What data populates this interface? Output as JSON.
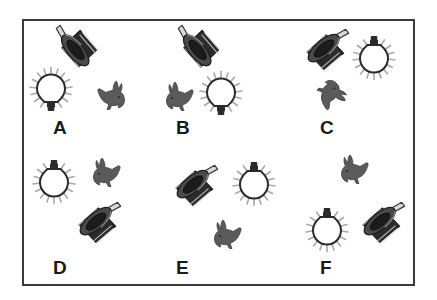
{
  "figure": {
    "border_color": "#3a3a3a",
    "background_color": "#ffffff"
  },
  "colors": {
    "hat_body": "#2b2b2b",
    "hat_highlight": "#e8e8e8",
    "hat_brim": "#4a4a4a",
    "wand": "#d9d9d9",
    "rabbit": "#5a5a5a",
    "bulb_glass": "#ffffff",
    "bulb_outline": "#2b2b2b",
    "bulb_rays": "#a9a9a9",
    "label_text": "#1b1b1b"
  },
  "icons": {
    "hat": "top-hat-with-wand-icon",
    "bulb": "light-bulb-icon",
    "rabbit": "rabbit-icon"
  },
  "panels": [
    {
      "id": "A",
      "label": "A",
      "objects": [
        {
          "type": "hat",
          "name": "top-hat-with-wand-icon",
          "left": 48,
          "top": 23,
          "rotate": 28
        },
        {
          "type": "bulb",
          "name": "light-bulb-icon",
          "left": 29,
          "top": 66,
          "rotate": 0
        },
        {
          "type": "rabbit",
          "name": "rabbit-icon",
          "left": 96,
          "top": 79,
          "rotate": 0,
          "flip": true
        }
      ]
    },
    {
      "id": "B",
      "label": "B",
      "objects": [
        {
          "type": "hat",
          "name": "top-hat-with-wand-icon",
          "left": 170,
          "top": 23,
          "rotate": 28
        },
        {
          "type": "rabbit",
          "name": "rabbit-icon",
          "left": 165,
          "top": 80,
          "rotate": 0,
          "flip": false
        },
        {
          "type": "bulb",
          "name": "light-bulb-icon",
          "left": 199,
          "top": 70,
          "rotate": 0
        }
      ]
    },
    {
      "id": "C",
      "label": "C",
      "objects": [
        {
          "type": "hat",
          "name": "top-hat-with-wand-icon",
          "left": 296,
          "top": 24,
          "rotate": 118
        },
        {
          "type": "bulb",
          "name": "light-bulb-icon",
          "left": 352,
          "top": 31,
          "rotate": 180
        },
        {
          "type": "rabbit",
          "name": "rabbit-icon",
          "left": 316,
          "top": 80,
          "rotate": 128,
          "flip": false
        }
      ]
    },
    {
      "id": "D",
      "label": "D",
      "objects": [
        {
          "type": "bulb",
          "name": "light-bulb-icon",
          "left": 32,
          "top": 155,
          "rotate": 180
        },
        {
          "type": "rabbit",
          "name": "rabbit-icon",
          "left": 92,
          "top": 156,
          "rotate": 0,
          "flip": false
        },
        {
          "type": "hat",
          "name": "top-hat-with-wand-icon",
          "left": 68,
          "top": 197,
          "rotate": 118
        }
      ]
    },
    {
      "id": "E",
      "label": "E",
      "objects": [
        {
          "type": "hat",
          "name": "top-hat-with-wand-icon",
          "left": 165,
          "top": 160,
          "rotate": 118
        },
        {
          "type": "bulb",
          "name": "light-bulb-icon",
          "left": 232,
          "top": 157,
          "rotate": 180
        },
        {
          "type": "rabbit",
          "name": "rabbit-icon",
          "left": 213,
          "top": 218,
          "rotate": 0,
          "flip": false
        }
      ]
    },
    {
      "id": "F",
      "label": "F",
      "objects": [
        {
          "type": "rabbit",
          "name": "rabbit-icon",
          "left": 340,
          "top": 153,
          "rotate": 0,
          "flip": false
        },
        {
          "type": "bulb",
          "name": "light-bulb-icon",
          "left": 305,
          "top": 203,
          "rotate": 180
        },
        {
          "type": "hat",
          "name": "top-hat-with-wand-icon",
          "left": 352,
          "top": 197,
          "rotate": 118
        }
      ]
    }
  ],
  "labels": [
    {
      "text": "A",
      "left": 53,
      "top": 118
    },
    {
      "text": "B",
      "left": 176,
      "top": 118
    },
    {
      "text": "C",
      "left": 320,
      "top": 118
    },
    {
      "text": "D",
      "left": 53,
      "top": 258
    },
    {
      "text": "E",
      "left": 176,
      "top": 258
    },
    {
      "text": "F",
      "left": 320,
      "top": 258
    }
  ]
}
